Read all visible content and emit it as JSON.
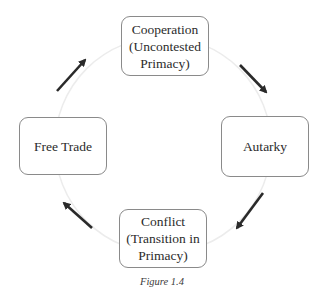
{
  "diagram": {
    "type": "cycle",
    "nodes": [
      {
        "id": "cooperation",
        "line1": "Cooperation",
        "line2": "(Uncontested",
        "line3": "Primacy)"
      },
      {
        "id": "autarky",
        "line1": "Autarky"
      },
      {
        "id": "conflict",
        "line1": "Conflict",
        "line2": "(Transition in",
        "line3": "Primacy)"
      },
      {
        "id": "free_trade",
        "line1": "Free Trade"
      }
    ],
    "edges": [
      {
        "from": "cooperation",
        "to": "autarky",
        "direction": "clockwise"
      },
      {
        "from": "autarky",
        "to": "conflict",
        "direction": "clockwise"
      },
      {
        "from": "conflict",
        "to": "free_trade",
        "direction": "clockwise"
      },
      {
        "from": "free_trade",
        "to": "cooperation",
        "direction": "clockwise"
      }
    ],
    "colors": {
      "arrow": "#2a2a2a",
      "box_border": "#8a8a8a",
      "circle": "#ececec",
      "text": "#2b2b2b"
    }
  },
  "caption": "Figure 1.4"
}
